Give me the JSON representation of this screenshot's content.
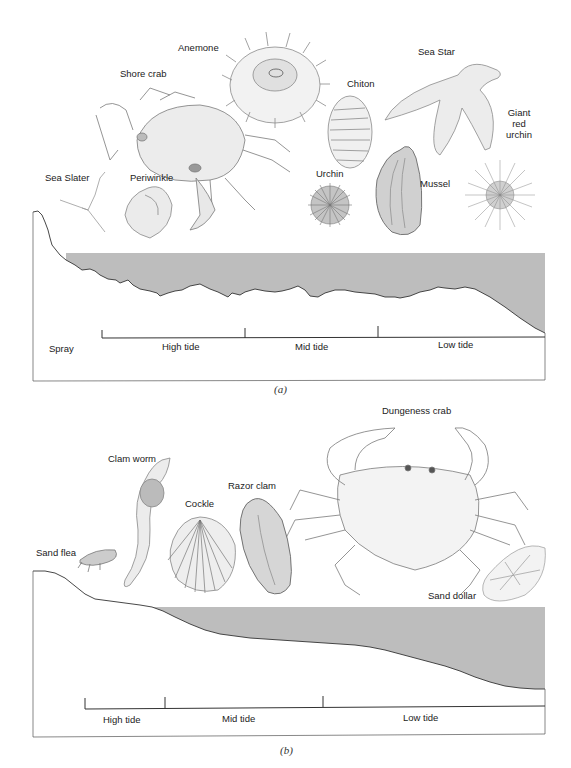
{
  "figure": {
    "colors": {
      "water": "#bdbdbd",
      "line": "#333333",
      "frame": "#555555",
      "sketch": "#8a8a8a",
      "background": "#ffffff"
    }
  },
  "panel_a": {
    "caption": "(a)",
    "organisms": [
      {
        "name": "Anemone",
        "icon": "anemone-icon"
      },
      {
        "name": "Shore crab",
        "icon": "shore-crab-icon"
      },
      {
        "name": "Sea Star",
        "icon": "sea-star-icon"
      },
      {
        "name": "Chiton",
        "icon": "chiton-icon"
      },
      {
        "name": "Giant red urchin",
        "icon": "giant-red-urchin-icon",
        "lines": [
          "Giant",
          "red",
          "urchin"
        ]
      },
      {
        "name": "Sea Slater",
        "icon": "sea-slater-icon"
      },
      {
        "name": "Periwinkle",
        "icon": "periwinkle-icon"
      },
      {
        "name": "Urchin",
        "icon": "urchin-icon"
      },
      {
        "name": "Mussel",
        "icon": "mussel-icon"
      }
    ],
    "zones": [
      "Spray",
      "High tide",
      "Mid tide",
      "Low tide"
    ],
    "shore_type": "rocky"
  },
  "panel_b": {
    "caption": "(b)",
    "organisms": [
      {
        "name": "Dungeness crab",
        "icon": "dungeness-crab-icon"
      },
      {
        "name": "Clam worm",
        "icon": "clam-worm-icon"
      },
      {
        "name": "Razor clam",
        "icon": "razor-clam-icon"
      },
      {
        "name": "Cockle",
        "icon": "cockle-icon"
      },
      {
        "name": "Sand flea",
        "icon": "sand-flea-icon"
      },
      {
        "name": "Sand dollar",
        "icon": "sand-dollar-icon"
      }
    ],
    "zones": [
      "High tide",
      "Mid tide",
      "Low tide"
    ],
    "shore_type": "sandy"
  }
}
